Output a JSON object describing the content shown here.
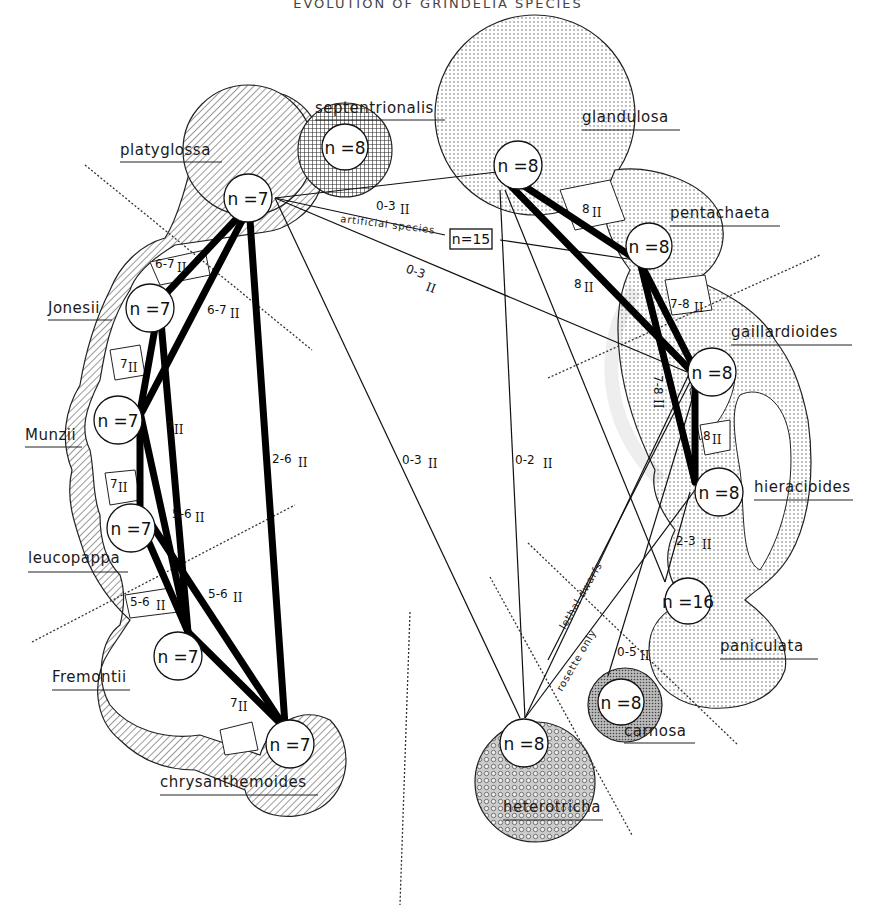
{
  "title": "EVOLUTION OF GRINDELIA SPECIES",
  "colors": {
    "ink": "#111111",
    "background": "#ffffff",
    "hatch": "#333333",
    "dots": "#555555"
  },
  "pattern_legend": {
    "hatch": "n=7 group (diagonal hatching)",
    "crosshatch": "septentrionalis (cross-hatching)",
    "dots": "n=8 group (stippled dots)",
    "dense": "carnosa (dense stipple)",
    "rings": "heterotricha (circle stipple)"
  },
  "species": [
    {
      "id": "platyglossa",
      "label": "platyglossa",
      "n": "n =7",
      "pattern": "hatch"
    },
    {
      "id": "septentrionalis",
      "label": "septentrionalis",
      "n": "n =8",
      "pattern": "crosshatch"
    },
    {
      "id": "glandulosa",
      "label": "glandulosa",
      "n": "n =8",
      "pattern": "dots"
    },
    {
      "id": "pentachaeta",
      "label": "pentachaeta",
      "n": "n =8",
      "pattern": "dots"
    },
    {
      "id": "Jonesii",
      "label": "Jonesii",
      "n": "n =7",
      "pattern": "hatch"
    },
    {
      "id": "gaillardioides",
      "label": "gaillardioides",
      "n": "n =8",
      "pattern": "dots"
    },
    {
      "id": "Munzii",
      "label": "Munzii",
      "n": "n =7",
      "pattern": "hatch"
    },
    {
      "id": "hieracioides",
      "label": "hieracioides",
      "n": "n =8",
      "pattern": "dots"
    },
    {
      "id": "leucopappa",
      "label": "leucopappa",
      "n": "n =7",
      "pattern": "hatch"
    },
    {
      "id": "paniculata",
      "label": "paniculata",
      "n": "n =16",
      "pattern": "dots"
    },
    {
      "id": "Fremontii",
      "label": "Fremontii",
      "n": "n =7",
      "pattern": "hatch"
    },
    {
      "id": "carnosa",
      "label": "carnosa",
      "n": "n =8",
      "pattern": "dense"
    },
    {
      "id": "chrysanthemoides",
      "label": "chrysanthemoides",
      "n": "n =7",
      "pattern": "hatch"
    },
    {
      "id": "heterotricha",
      "label": "heterotricha",
      "n": "n =8",
      "pattern": "rings"
    }
  ],
  "artificial": {
    "label": "artificial species",
    "n": "n=15"
  },
  "edge_labels": [
    {
      "text": "6-7",
      "roman": "II"
    },
    {
      "text": "6-7",
      "roman": "II"
    },
    {
      "text": "7",
      "roman": "II"
    },
    {
      "text": "7",
      "roman": "II"
    },
    {
      "text": "7",
      "roman": "II"
    },
    {
      "text": "5-6",
      "roman": "II"
    },
    {
      "text": "5-6",
      "roman": "II"
    },
    {
      "text": "5-6",
      "roman": "II"
    },
    {
      "text": "7",
      "roman": "II"
    },
    {
      "text": "2-6",
      "roman": "II"
    },
    {
      "text": "0-3",
      "roman": "II"
    },
    {
      "text": "0-3",
      "roman": "II"
    },
    {
      "text": "0-3",
      "roman": "II"
    },
    {
      "text": "0-2",
      "roman": "II"
    },
    {
      "text": "8",
      "roman": "II"
    },
    {
      "text": "8",
      "roman": "II"
    },
    {
      "text": "7-8",
      "roman": "II"
    },
    {
      "text": "7-8",
      "roman": "II"
    },
    {
      "text": "8",
      "roman": "II"
    },
    {
      "text": "2-3",
      "roman": "II"
    },
    {
      "text": "0-5",
      "roman": "II"
    }
  ],
  "notes": {
    "lethal": "lethal dwarfs",
    "rosette": "rosette only"
  }
}
